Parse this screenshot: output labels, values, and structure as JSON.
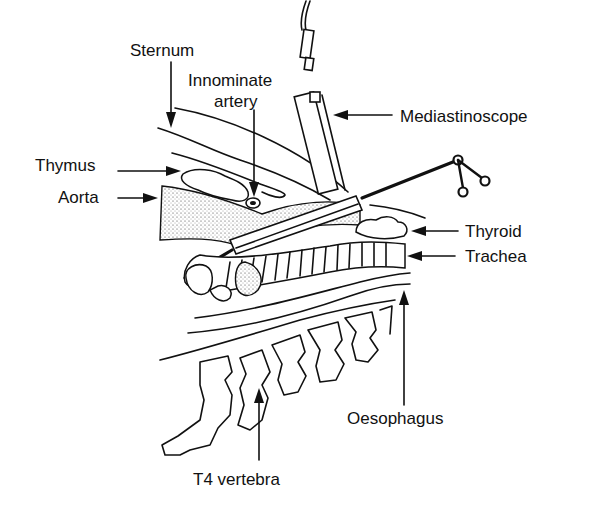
{
  "figure": {
    "labels": {
      "sternum": "Sternum",
      "innominate_line1": "Innominate",
      "innominate_line2": "artery",
      "mediastinoscope": "Mediastinoscope",
      "thymus": "Thymus",
      "aorta": "Aorta",
      "thyroid": "Thyroid",
      "trachea": "Trachea",
      "oesophagus": "Oesophagus",
      "t4_vertebra": "T4 vertebra"
    },
    "colors": {
      "ink": "#111111",
      "background": "#ffffff"
    }
  }
}
